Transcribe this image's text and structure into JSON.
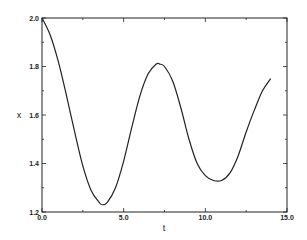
{
  "chart_data": {
    "type": "line",
    "title": "",
    "xlabel": "t",
    "ylabel": "x",
    "xlim": [
      0,
      15
    ],
    "ylim": [
      1.2,
      2.0
    ],
    "grid": false,
    "legend": null,
    "x_ticks": [
      0.0,
      5.0,
      10.0,
      15.0
    ],
    "x_tick_labels": [
      "0.0",
      "5.0",
      "10.0",
      "15.0"
    ],
    "y_ticks": [
      1.2,
      1.4,
      1.6,
      1.8,
      2.0
    ],
    "y_tick_labels": [
      "1.2",
      "1.4",
      "1.6",
      "1.8",
      "2.0"
    ],
    "series": [
      {
        "name": "x(t)",
        "color": "#222222",
        "x": [
          0.0,
          0.5,
          1.0,
          1.5,
          2.0,
          2.5,
          3.0,
          3.5,
          3.7,
          4.0,
          4.5,
          5.0,
          5.5,
          6.0,
          6.5,
          7.0,
          7.2,
          7.5,
          8.0,
          8.5,
          9.0,
          9.5,
          10.0,
          10.5,
          11.0,
          11.5,
          12.0,
          12.5,
          13.0,
          13.5,
          14.0
        ],
        "y": [
          2.0,
          1.93,
          1.82,
          1.68,
          1.53,
          1.39,
          1.29,
          1.24,
          1.23,
          1.24,
          1.3,
          1.41,
          1.55,
          1.68,
          1.77,
          1.81,
          1.81,
          1.8,
          1.74,
          1.63,
          1.5,
          1.4,
          1.35,
          1.33,
          1.33,
          1.36,
          1.43,
          1.53,
          1.62,
          1.7,
          1.75
        ]
      }
    ]
  }
}
